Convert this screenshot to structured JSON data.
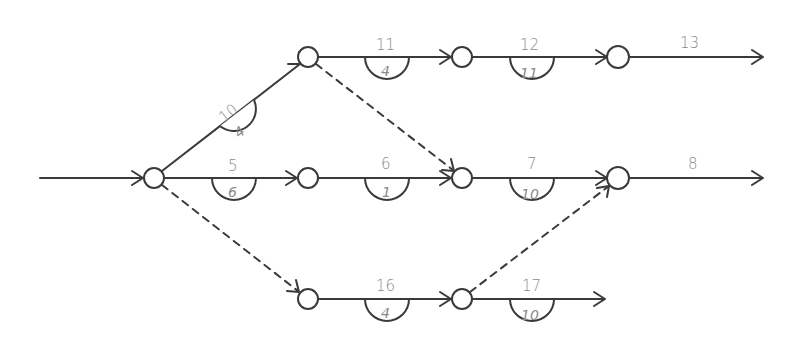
{
  "diagram": {
    "type": "activity-network",
    "colors": {
      "stroke": "#3a3a3a",
      "text": "#8a8a8a",
      "background": "#ffffff"
    },
    "nodes": [
      {
        "id": "n0",
        "x": 154,
        "y": 178
      },
      {
        "id": "t1",
        "x": 308,
        "y": 57
      },
      {
        "id": "t2",
        "x": 462,
        "y": 57
      },
      {
        "id": "t3",
        "x": 618,
        "y": 57
      },
      {
        "id": "m1",
        "x": 308,
        "y": 178
      },
      {
        "id": "m2",
        "x": 462,
        "y": 178
      },
      {
        "id": "m3",
        "x": 618,
        "y": 178
      },
      {
        "id": "b1",
        "x": 308,
        "y": 299
      },
      {
        "id": "b2",
        "x": 462,
        "y": 299
      }
    ],
    "edges": [
      {
        "from": "start",
        "to": "n0",
        "style": "solid",
        "label": "",
        "duration": ""
      },
      {
        "from": "n0",
        "to": "t1",
        "style": "solid",
        "label": "10",
        "duration": "4"
      },
      {
        "from": "n0",
        "to": "m1",
        "style": "solid",
        "label": "5",
        "duration": "6"
      },
      {
        "from": "n0",
        "to": "b1",
        "style": "dashed",
        "label": "",
        "duration": ""
      },
      {
        "from": "t1",
        "to": "t2",
        "style": "solid",
        "label": "11",
        "duration": "4"
      },
      {
        "from": "t1",
        "to": "m2",
        "style": "dashed",
        "label": "",
        "duration": ""
      },
      {
        "from": "t2",
        "to": "t3",
        "style": "solid",
        "label": "12",
        "duration": "11"
      },
      {
        "from": "t3",
        "to": "end",
        "style": "solid",
        "label": "13",
        "duration": ""
      },
      {
        "from": "m1",
        "to": "m2",
        "style": "solid",
        "label": "6",
        "duration": "1"
      },
      {
        "from": "m2",
        "to": "m3",
        "style": "solid",
        "label": "7",
        "duration": "10"
      },
      {
        "from": "m3",
        "to": "end",
        "style": "solid",
        "label": "8",
        "duration": ""
      },
      {
        "from": "b1",
        "to": "b2",
        "style": "solid",
        "label": "16",
        "duration": "4"
      },
      {
        "from": "b2",
        "to": "m3",
        "style": "dashed",
        "label": "",
        "duration": ""
      },
      {
        "from": "b2",
        "to": "end",
        "style": "solid",
        "label": "17",
        "duration": "10"
      }
    ]
  },
  "labels": {
    "a10": "10",
    "d10": "4",
    "a5": "5",
    "d5": "6",
    "a11": "11",
    "d11": "4",
    "a12": "12",
    "d12": "11",
    "a13": "13",
    "a6": "6",
    "d6": "1",
    "a7": "7",
    "d7": "10",
    "a8": "8",
    "a16": "16",
    "d16": "4",
    "a17": "17",
    "d17": "10"
  }
}
